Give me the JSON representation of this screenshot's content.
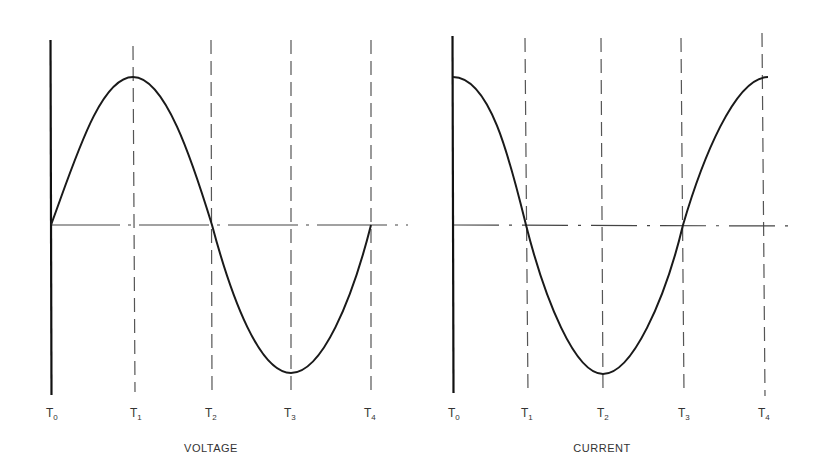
{
  "colors": {
    "ink": "#1a1a1a",
    "dash": "#555555",
    "text": "#333333",
    "background": "#ffffff"
  },
  "panels": [
    {
      "caption": "VOLTAGE",
      "tick_labels": [
        {
          "main": "T",
          "sub": "0"
        },
        {
          "main": "T",
          "sub": "1"
        },
        {
          "main": "T",
          "sub": "2"
        },
        {
          "main": "T",
          "sub": "3"
        },
        {
          "main": "T",
          "sub": "4"
        }
      ],
      "waveform": "sine",
      "description": "Starts at zero at T0, positive peak at T1, zero at T2, negative peak at T3, zero at T4"
    },
    {
      "caption": "CURRENT",
      "tick_labels": [
        {
          "main": "T",
          "sub": "0"
        },
        {
          "main": "T",
          "sub": "1"
        },
        {
          "main": "T",
          "sub": "2"
        },
        {
          "main": "T",
          "sub": "3"
        },
        {
          "main": "T",
          "sub": "4"
        }
      ],
      "waveform": "cosine",
      "description": "Positive peak at T0, zero at T1, negative peak at T2, zero at T3, positive peak at T4"
    }
  ]
}
